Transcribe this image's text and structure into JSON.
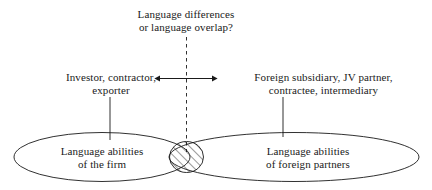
{
  "figure": {
    "title_question": {
      "line1": "Language differences",
      "line2": "or language overlap?"
    },
    "left_actor": {
      "line1": "Investor, contractor,",
      "line2": "exporter"
    },
    "right_actor": {
      "line1": "Foreign subsidiary, JV partner,",
      "line2": "contractee, intermediary"
    },
    "left_set": {
      "line1": "Language abilities",
      "line2": "of the firm"
    },
    "right_set": {
      "line1": "Language abilities",
      "line2": "of foreign partners"
    },
    "colors": {
      "stroke": "#1a1a1a",
      "text": "#1a1a1a",
      "background": "#ffffff",
      "hatch": "#333333"
    }
  }
}
